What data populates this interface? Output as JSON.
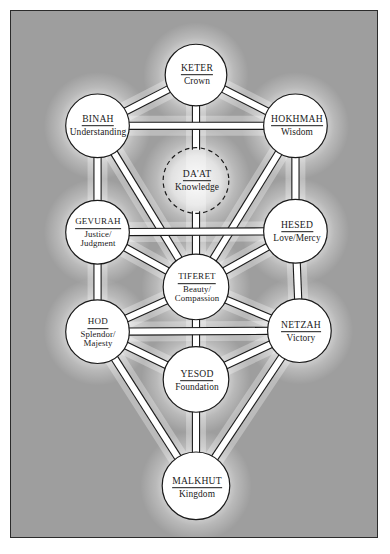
{
  "figure": {
    "frame_color": "#2b2b2b",
    "background_color": "#9e9e9e",
    "node_fill": "#ffffff",
    "node_stroke": "#1a1a1a",
    "path_fill": "#ffffff",
    "path_stroke": "#1a1a1a",
    "glow_color": "#ffffff"
  },
  "nodes": [
    {
      "id": "keter",
      "name": "KETER",
      "meaning": [
        "Crown"
      ],
      "cx": 196,
      "cy": 74,
      "r": 31,
      "dashed": false
    },
    {
      "id": "binah",
      "name": "BINAH",
      "meaning": [
        "Understanding"
      ],
      "cx": 97,
      "cy": 125,
      "r": 32,
      "dashed": false
    },
    {
      "id": "hokhmah",
      "name": "HOKHMAH",
      "meaning": [
        "Wisdom"
      ],
      "cx": 296,
      "cy": 125,
      "r": 32,
      "dashed": false
    },
    {
      "id": "daat",
      "name": "DA'AT",
      "meaning": [
        "Knowledge"
      ],
      "cx": 196,
      "cy": 180,
      "r": 33,
      "dashed": true
    },
    {
      "id": "gevurah",
      "name": "GEVURAH",
      "meaning": [
        "Justice/",
        "Judgment"
      ],
      "cx": 97,
      "cy": 232,
      "r": 32,
      "dashed": false
    },
    {
      "id": "hesed",
      "name": "HESED",
      "meaning": [
        "Love/Mercy"
      ],
      "cx": 296,
      "cy": 231,
      "r": 32,
      "dashed": false
    },
    {
      "id": "tiferet",
      "name": "TIFERET",
      "meaning": [
        "Beauty/",
        "Compassion"
      ],
      "cx": 196,
      "cy": 287,
      "r": 33,
      "dashed": false
    },
    {
      "id": "hod",
      "name": "HOD",
      "meaning": [
        "Splendor/",
        "Majesty"
      ],
      "cx": 97,
      "cy": 332,
      "r": 32,
      "dashed": false
    },
    {
      "id": "netzah",
      "name": "NETZAH",
      "meaning": [
        "Victory"
      ],
      "cx": 300,
      "cy": 331,
      "r": 32,
      "dashed": false
    },
    {
      "id": "yesod",
      "name": "YESOD",
      "meaning": [
        "Foundation"
      ],
      "cx": 196,
      "cy": 380,
      "r": 33,
      "dashed": false
    },
    {
      "id": "malkhut",
      "name": "MALKHUT",
      "meaning": [
        "Kingdom"
      ],
      "cx": 196,
      "cy": 487,
      "r": 34,
      "dashed": false
    }
  ],
  "paths": [
    {
      "from": "keter",
      "to": "binah"
    },
    {
      "from": "keter",
      "to": "hokhmah"
    },
    {
      "from": "keter",
      "to": "daat"
    },
    {
      "from": "binah",
      "to": "hokhmah"
    },
    {
      "from": "binah",
      "to": "gevurah"
    },
    {
      "from": "binah",
      "to": "tiferet"
    },
    {
      "from": "hokhmah",
      "to": "hesed"
    },
    {
      "from": "hokhmah",
      "to": "tiferet"
    },
    {
      "from": "daat",
      "to": "tiferet"
    },
    {
      "from": "gevurah",
      "to": "hesed"
    },
    {
      "from": "gevurah",
      "to": "tiferet"
    },
    {
      "from": "gevurah",
      "to": "hod"
    },
    {
      "from": "hesed",
      "to": "tiferet"
    },
    {
      "from": "hesed",
      "to": "netzah"
    },
    {
      "from": "tiferet",
      "to": "hod"
    },
    {
      "from": "tiferet",
      "to": "netzah"
    },
    {
      "from": "tiferet",
      "to": "yesod"
    },
    {
      "from": "hod",
      "to": "netzah"
    },
    {
      "from": "hod",
      "to": "yesod"
    },
    {
      "from": "hod",
      "to": "malkhut"
    },
    {
      "from": "netzah",
      "to": "yesod"
    },
    {
      "from": "netzah",
      "to": "malkhut"
    },
    {
      "from": "yesod",
      "to": "malkhut"
    }
  ]
}
